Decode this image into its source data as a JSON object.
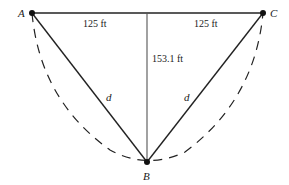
{
  "diagram": {
    "type": "geometry-triangle",
    "points": {
      "A": {
        "label": "A",
        "x": 32,
        "y": 13
      },
      "B": {
        "label": "B",
        "x": 147,
        "y": 162
      },
      "C": {
        "label": "C",
        "x": 263,
        "y": 13
      }
    },
    "segments": [
      {
        "id": "AC",
        "from": "A",
        "to": "C",
        "style": "solid"
      },
      {
        "id": "AB",
        "from": "A",
        "to": "B",
        "style": "solid",
        "label": "d"
      },
      {
        "id": "CB",
        "from": "C",
        "to": "B",
        "style": "solid",
        "label": "d"
      },
      {
        "id": "height",
        "from": "midAC",
        "to": "B",
        "style": "solid",
        "label": "153.1 ft"
      }
    ],
    "curve": {
      "style": "dashed",
      "description": "parabolic arc from A through B to C"
    },
    "labels": {
      "point_a": "A",
      "point_b": "B",
      "point_c": "C",
      "left_half": "125 ft",
      "right_half": "125 ft",
      "height": "153.1 ft",
      "left_side": "d",
      "right_side": "d"
    }
  }
}
